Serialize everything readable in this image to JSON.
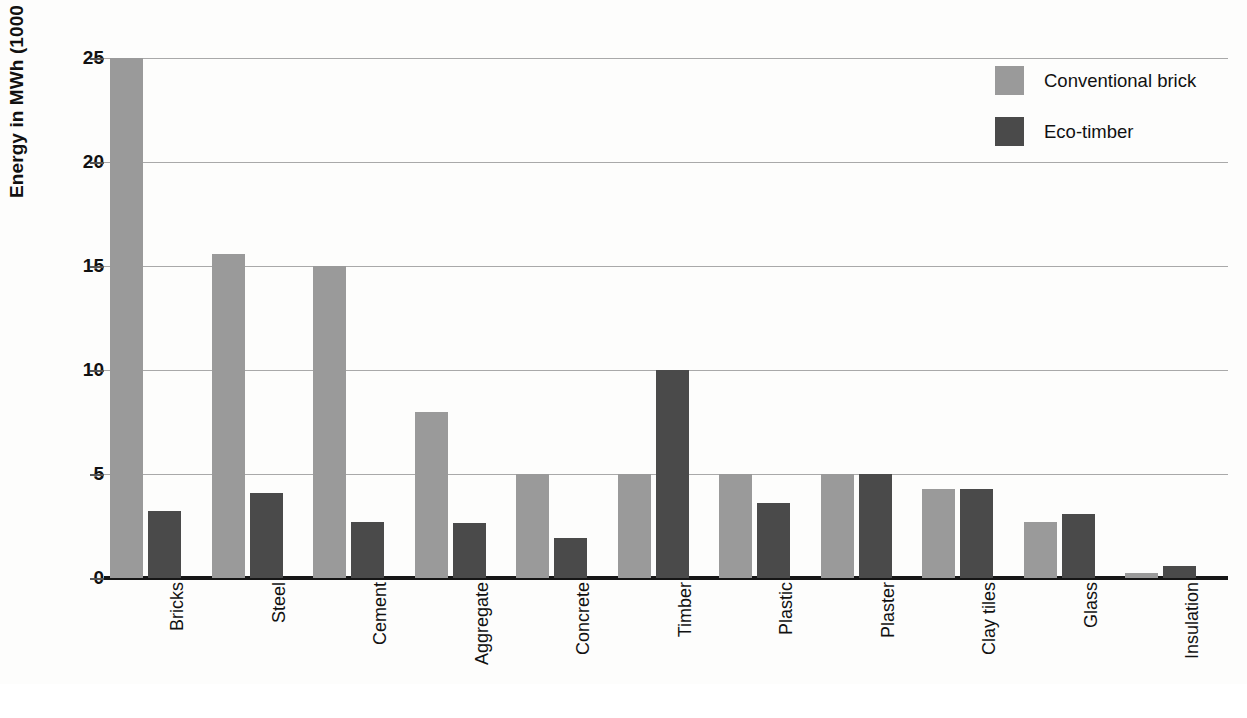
{
  "chart_data": {
    "type": "bar",
    "title": "",
    "xlabel": "",
    "ylabel": "Energy in MWh (1000 kWh)",
    "ylim": [
      0,
      25
    ],
    "yticks": [
      0,
      5,
      10,
      15,
      20,
      25
    ],
    "ytick_labels": [
      "0",
      "5",
      "10",
      "15",
      "20",
      "25"
    ],
    "grid": true,
    "legend_position": "top-right",
    "categories": [
      "Bricks",
      "Steel",
      "Cement",
      "Aggregate",
      "Concrete",
      "Timber",
      "Plastic",
      "Plaster",
      "Clay tiles",
      "Glass",
      "Insulation"
    ],
    "series": [
      {
        "name": "Conventional brick",
        "color": "#9a9a9a",
        "values": [
          25,
          15.6,
          15,
          8,
          5,
          5,
          5,
          5,
          4.3,
          2.7,
          0.25
        ]
      },
      {
        "name": "Eco-timber",
        "color": "#4a4a4a",
        "values": [
          3.2,
          4.1,
          2.7,
          2.65,
          1.9,
          10,
          3.6,
          5,
          4.3,
          3.1,
          0.6
        ]
      }
    ]
  },
  "legend": {
    "items": [
      {
        "label": "Conventional brick",
        "swatch": "legend-swatch-conventional"
      },
      {
        "label": "Eco-timber",
        "swatch": "legend-swatch-eco"
      }
    ]
  },
  "axes": {
    "y_title": "Energy in MWh (1000 kWh)"
  }
}
